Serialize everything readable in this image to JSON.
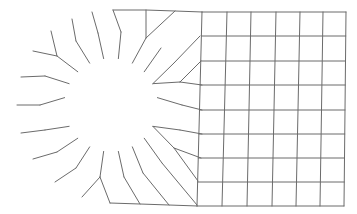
{
  "diagram": {
    "type": "finite-element-mesh",
    "colors": {
      "background": "#ffffff",
      "line": "#6b6b6b"
    },
    "hole": {
      "cx": 111,
      "cy": 105,
      "r": 47
    },
    "rings": [
      {
        "r": 47
      },
      {
        "r": 70
      }
    ],
    "outer_arc": [
      [
        113,
        10
      ],
      [
        92,
        12
      ],
      [
        72,
        19
      ],
      [
        51,
        31
      ],
      [
        33,
        51
      ],
      [
        21,
        77
      ],
      [
        17,
        105
      ],
      [
        21,
        133
      ],
      [
        33,
        159
      ],
      [
        55,
        182
      ],
      [
        82,
        197
      ],
      [
        110,
        203
      ]
    ],
    "middle_ring": [
      [
        121,
        32
      ],
      [
        98,
        33
      ],
      [
        76,
        41
      ],
      [
        57,
        56
      ],
      [
        45,
        76
      ],
      [
        40,
        105
      ],
      [
        45,
        130
      ],
      [
        57,
        152
      ],
      [
        76,
        168
      ],
      [
        100,
        177
      ],
      [
        124,
        177
      ],
      [
        143,
        173
      ],
      [
        162,
        163
      ],
      [
        174,
        148
      ],
      [
        180,
        130
      ],
      [
        182,
        105
      ],
      [
        180,
        82
      ],
      [
        174,
        63
      ],
      [
        161,
        48
      ],
      [
        146,
        38
      ]
    ],
    "inner_ring_angles_deg": [
      0,
      18,
      36,
      54,
      72,
      90,
      108,
      126,
      144,
      162,
      180,
      198,
      216,
      234,
      252,
      270,
      288,
      306,
      324,
      342
    ],
    "outer_ring_nodes": [
      [
        113,
        10
      ],
      [
        92,
        12
      ],
      [
        72,
        19
      ],
      [
        51,
        31
      ],
      [
        33,
        51
      ],
      [
        21,
        77
      ],
      [
        17,
        105
      ],
      [
        21,
        133
      ],
      [
        33,
        159
      ],
      [
        55,
        182
      ],
      [
        82,
        197
      ],
      [
        110,
        203
      ],
      [
        140,
        204
      ],
      [
        169,
        205
      ],
      [
        197,
        205
      ],
      [
        198,
        181
      ],
      [
        201,
        158
      ],
      [
        202,
        134
      ],
      [
        202,
        110
      ],
      [
        202,
        85
      ],
      [
        201,
        61
      ],
      [
        200,
        36
      ],
      [
        175,
        11
      ],
      [
        146,
        10
      ]
    ],
    "grid": {
      "x": [
        202,
        227,
        251,
        276,
        300,
        323,
        346
      ],
      "x_bottom": [
        197,
        222,
        247,
        272,
        296,
        320,
        344
      ],
      "y": [
        12,
        36,
        61,
        85,
        110,
        134,
        158,
        182,
        206
      ]
    }
  }
}
